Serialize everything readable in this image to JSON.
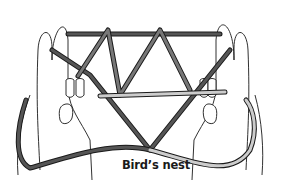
{
  "figure": {
    "caption": "Bird’s nest",
    "colors": {
      "background": "#ffffff",
      "outline": "#1a1a1a",
      "string_dark": "#555555",
      "string_mid": "#8a8a8a",
      "string_light": "#c8c8c8"
    }
  }
}
